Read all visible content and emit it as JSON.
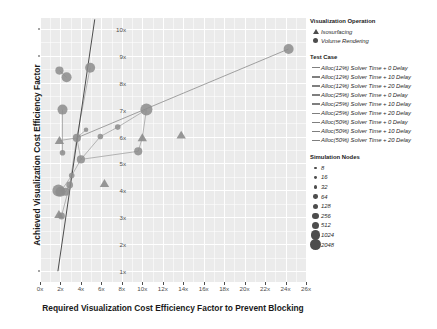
{
  "chart_data": {
    "type": "scatter",
    "title": "",
    "xlabel": "Required Visualization Cost Efficiency Factor to Prevent Blocking",
    "ylabel": "Achieved Visualization Cost Efficiency Factor",
    "xlim": [
      0,
      26
    ],
    "ylim": [
      0.6,
      10.4
    ],
    "xticks": [
      "0x",
      "2x",
      "4x",
      "6x",
      "8x",
      "10x",
      "12x",
      "14x",
      "16x",
      "18x",
      "20x",
      "22x",
      "24x",
      "26x"
    ],
    "xtick_values": [
      0,
      2,
      4,
      6,
      8,
      10,
      12,
      14,
      16,
      18,
      20,
      22,
      24,
      26
    ],
    "yticks": [
      "1x",
      "2x",
      "3x",
      "4x",
      "5x",
      "6x",
      "7x",
      "8x",
      "9x",
      "10x"
    ],
    "ytick_values": [
      1,
      2,
      3,
      4,
      5,
      6,
      7,
      8,
      9,
      10
    ],
    "grid": true,
    "legend_position": "right",
    "panel_background": "#ebebeb",
    "gridline_color": "#ffffff",
    "series": [
      {
        "name": "Alloc(12%) Solver Time + 0 Delay",
        "shape": "circle",
        "color": "#8c8c8c",
        "points": [
          {
            "x": 1.9,
            "y": 8.45,
            "nodes": 256
          },
          {
            "x": 2.6,
            "y": 8.2,
            "nodes": 512
          },
          {
            "x": 4.9,
            "y": 8.55,
            "nodes": 512
          },
          {
            "x": 4.5,
            "y": 6.25,
            "nodes": 32
          },
          {
            "x": 3.6,
            "y": 5.95,
            "nodes": 256
          }
        ]
      },
      {
        "name": "Alloc(12%) Solver Time + 10 Delay",
        "shape": "circle",
        "color": "#8c8c8c",
        "points": [
          {
            "x": 2.2,
            "y": 7.0,
            "nodes": 512
          },
          {
            "x": 2.2,
            "y": 5.4,
            "nodes": 64
          },
          {
            "x": 3.1,
            "y": 4.55,
            "nodes": 64
          },
          {
            "x": 2.9,
            "y": 4.2,
            "nodes": 128
          }
        ]
      },
      {
        "name": "Alloc(12%) Solver Time + 20 Delay",
        "shape": "circle",
        "color": "#8c8c8c",
        "points": [
          {
            "x": 1.8,
            "y": 4.0,
            "nodes": 1024
          },
          {
            "x": 2.5,
            "y": 3.95,
            "nodes": 256
          },
          {
            "x": 2.1,
            "y": 3.05,
            "nodes": 128
          }
        ]
      },
      {
        "name": "Alloc(25%) Solver Time + 0 Delay",
        "shape": "circle",
        "color": "#8c8c8c",
        "points": [
          {
            "x": 24.3,
            "y": 9.25,
            "nodes": 512
          },
          {
            "x": 10.4,
            "y": 7.0,
            "nodes": 1024
          },
          {
            "x": 7.6,
            "y": 6.35,
            "nodes": 64
          },
          {
            "x": 5.9,
            "y": 6.0,
            "nodes": 64
          }
        ]
      },
      {
        "name": "Alloc(25%) Solver Time + 10 Delay",
        "shape": "circle",
        "color": "#8c8c8c",
        "points": [
          {
            "x": 9.6,
            "y": 5.45,
            "nodes": 256
          },
          {
            "x": 4.0,
            "y": 5.15,
            "nodes": 256
          }
        ]
      },
      {
        "name": "Alloc(25%) Solver Time + 20 Delay",
        "shape": "triangle",
        "color": "#8c8c8c",
        "points": [
          {
            "x": 13.8,
            "y": 6.05,
            "nodes": 256
          },
          {
            "x": 10.0,
            "y": 5.95,
            "nodes": 256
          }
        ]
      },
      {
        "name": "Alloc(50%) Solver Time + 0 Delay",
        "shape": "triangle",
        "color": "#8c8c8c",
        "points": [
          {
            "x": 1.9,
            "y": 5.85,
            "nodes": 256
          },
          {
            "x": 6.3,
            "y": 4.25,
            "nodes": 256
          }
        ]
      },
      {
        "name": "Alloc(50%) Solver Time + 10 Delay",
        "shape": "triangle",
        "color": "#8c8c8c",
        "points": [
          {
            "x": 1.85,
            "y": 3.1,
            "nodes": 256
          }
        ]
      },
      {
        "name": "Alloc(50%) Solver Time + 20 Delay",
        "shape": "circle",
        "color": "#8c8c8c",
        "points": [
          {
            "x": 2.0,
            "y": 3.95,
            "nodes": 512
          }
        ]
      }
    ],
    "reference_lines": [
      {
        "name": "steep-reference-line",
        "x1": 1.75,
        "y1": 1.0,
        "x2": 5.35,
        "y2": 10.35,
        "color": "#4d4d4d"
      },
      {
        "name": "shallow-reference-line",
        "x1": 3.6,
        "y1": 5.95,
        "x2": 24.3,
        "y2": 9.25,
        "color": "#8c8c8c"
      }
    ],
    "connector_paths": [
      [
        [
          4.9,
          8.55
        ],
        [
          3.6,
          5.95
        ],
        [
          2.9,
          4.2
        ],
        [
          2.1,
          3.05
        ]
      ],
      [
        [
          4.5,
          6.25
        ],
        [
          3.6,
          5.95
        ],
        [
          4.0,
          5.15
        ],
        [
          3.1,
          4.55
        ],
        [
          2.0,
          3.95
        ]
      ],
      [
        [
          1.9,
          8.45
        ],
        [
          2.6,
          8.2
        ]
      ],
      [
        [
          2.2,
          7.0
        ],
        [
          2.2,
          5.4
        ]
      ],
      [
        [
          1.9,
          5.85
        ],
        [
          3.6,
          5.95
        ]
      ],
      [
        [
          10.4,
          7.0
        ],
        [
          7.6,
          6.35
        ],
        [
          5.9,
          6.0
        ],
        [
          4.0,
          5.15
        ]
      ],
      [
        [
          10.4,
          7.0
        ],
        [
          10.0,
          5.95
        ],
        [
          9.6,
          5.45
        ],
        [
          4.0,
          5.15
        ]
      ],
      [
        [
          1.8,
          4.0
        ],
        [
          2.5,
          3.95
        ],
        [
          2.9,
          4.2
        ]
      ],
      [
        [
          1.85,
          3.1
        ],
        [
          2.1,
          3.05
        ]
      ]
    ]
  },
  "legend": {
    "operation": {
      "title": "Visualization Operation",
      "items": [
        {
          "label": "Isosurfacing",
          "shape": "triangle"
        },
        {
          "label": "Volume Rendering",
          "shape": "circle"
        }
      ]
    },
    "test_case": {
      "title": "Test Case",
      "items": [
        {
          "label": "Alloc(12%)  Solver Time + 0 Delay"
        },
        {
          "label": "Alloc(12%)  Solver Time + 10 Delay"
        },
        {
          "label": "Alloc(12%)  Solver Time + 20 Delay"
        },
        {
          "label": "Alloc(25%)  Solver Time + 0 Delay"
        },
        {
          "label": "Alloc(25%)  Solver Time + 10 Delay"
        },
        {
          "label": "Alloc(25%)  Solver Time + 20 Delay"
        },
        {
          "label": "Alloc(50%)  Solver Time + 0 Delay"
        },
        {
          "label": "Alloc(50%)  Solver Time + 10 Delay"
        },
        {
          "label": "Alloc(50%)  Solver Time + 20 Delay"
        }
      ]
    },
    "simulation_nodes": {
      "title": "Simulation Nodes",
      "items": [
        {
          "label": "8",
          "size": 1.5
        },
        {
          "label": "16",
          "size": 1.9
        },
        {
          "label": "32",
          "size": 2.3
        },
        {
          "label": "64",
          "size": 2.8
        },
        {
          "label": "128",
          "size": 3.4
        },
        {
          "label": "256",
          "size": 4.1
        },
        {
          "label": "512",
          "size": 5.0
        },
        {
          "label": "1024",
          "size": 6.0
        },
        {
          "label": "2048",
          "size": 7.2
        }
      ]
    }
  }
}
